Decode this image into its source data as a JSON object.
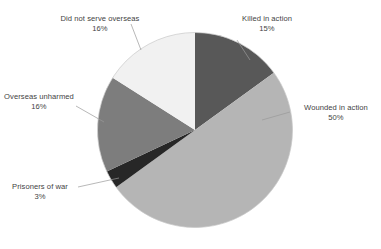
{
  "chart_data": {
    "type": "pie",
    "title": "",
    "subtitle": "",
    "xlabel": "",
    "ylabel": "",
    "legend_position": "none",
    "grid": false,
    "units": "percent",
    "total": 100,
    "start_angle_deg": 0,
    "direction": "clockwise",
    "categories": [
      "Killed in action",
      "Wounded in action",
      "Prisoners of war",
      "Overseas unharmed",
      "Did not serve overseas"
    ],
    "values": [
      15,
      50,
      3,
      16,
      16
    ],
    "labels": [
      "15%",
      "50%",
      "3%",
      "16%",
      "16%"
    ],
    "colors": [
      "#585858",
      "#b5b5b5",
      "#272727",
      "#7d7d7d",
      "#f1f1f1"
    ],
    "slices": [
      {
        "name": "Killed in action",
        "value": 15,
        "label": "15%",
        "color": "#585858",
        "start_deg": 0,
        "end_deg": 54
      },
      {
        "name": "Wounded in action",
        "value": 50,
        "label": "50%",
        "color": "#b5b5b5",
        "start_deg": 54,
        "end_deg": 234
      },
      {
        "name": "Prisoners of war",
        "value": 3,
        "label": "3%",
        "color": "#272727",
        "start_deg": 234,
        "end_deg": 244.8
      },
      {
        "name": "Overseas unharmed",
        "value": 16,
        "label": "16%",
        "color": "#7d7d7d",
        "start_deg": 244.8,
        "end_deg": 302.4
      },
      {
        "name": "Did not serve overseas",
        "value": 16,
        "label": "16%",
        "color": "#f1f1f1",
        "start_deg": 302.4,
        "end_deg": 360
      }
    ]
  },
  "annotations": {
    "killed": {
      "name": "Killed in action",
      "pct": "15%"
    },
    "wounded": {
      "name": "Wounded in action",
      "pct": "50%"
    },
    "prisoners": {
      "name": "Prisoners of war",
      "pct": "3%"
    },
    "unharmed": {
      "name": "Overseas unharmed",
      "pct": "16%"
    },
    "notserved": {
      "name": "Did not serve overseas",
      "pct": "16%"
    }
  },
  "style": {
    "background": "#ffffff",
    "leader_line_color": "#9a9a9a",
    "slice_edge_color": "#ffffff",
    "text_color": "#3f3f3f"
  }
}
